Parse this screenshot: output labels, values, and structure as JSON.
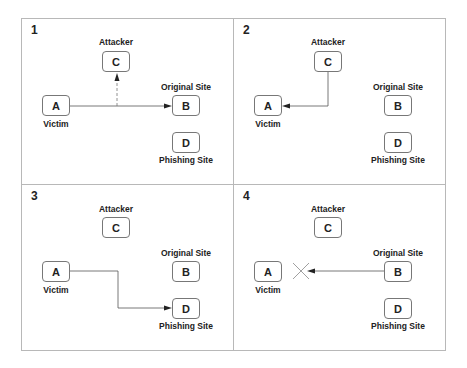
{
  "diagram": {
    "panels": [
      {
        "number": "1",
        "nodes": {
          "A": {
            "letter": "A",
            "label": "Victim"
          },
          "B": {
            "letter": "B",
            "label": "Original Site"
          },
          "C": {
            "letter": "C",
            "label": "Attacker"
          },
          "D": {
            "letter": "D",
            "label": "Phishing Site"
          }
        },
        "edges": [
          {
            "from": "A",
            "to": "B",
            "style": "solid"
          },
          {
            "from": "A-B line",
            "to": "C",
            "style": "dashed"
          }
        ]
      },
      {
        "number": "2",
        "nodes": {
          "A": {
            "letter": "A",
            "label": "Victim"
          },
          "B": {
            "letter": "B",
            "label": "Original Site"
          },
          "C": {
            "letter": "C",
            "label": "Attacker"
          },
          "D": {
            "letter": "D",
            "label": "Phishing Site"
          }
        },
        "edges": [
          {
            "from": "C",
            "to": "A",
            "style": "solid"
          }
        ]
      },
      {
        "number": "3",
        "nodes": {
          "A": {
            "letter": "A",
            "label": "Victim"
          },
          "B": {
            "letter": "B",
            "label": "Original Site"
          },
          "C": {
            "letter": "C",
            "label": "Attacker"
          },
          "D": {
            "letter": "D",
            "label": "Phishing Site"
          }
        },
        "edges": [
          {
            "from": "A",
            "to": "D",
            "style": "solid"
          }
        ]
      },
      {
        "number": "4",
        "nodes": {
          "A": {
            "letter": "A",
            "label": "Victim"
          },
          "B": {
            "letter": "B",
            "label": "Original Site"
          },
          "C": {
            "letter": "C",
            "label": "Attacker"
          },
          "D": {
            "letter": "D",
            "label": "Phishing Site"
          }
        },
        "edges": [
          {
            "from": "B",
            "to": "A",
            "style": "solid",
            "blocked": true
          }
        ]
      }
    ],
    "colors": {
      "border": "#b8b8b8",
      "line": "#555555",
      "text": "#222222"
    }
  }
}
